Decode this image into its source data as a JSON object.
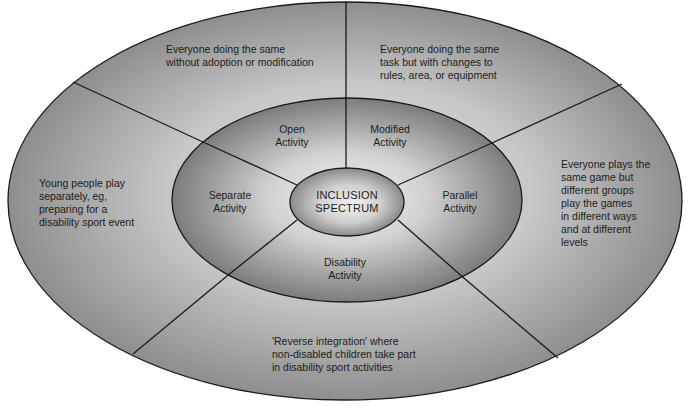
{
  "diagram": {
    "title": "Inclusion Spectrum",
    "type": "concentric-ellipse-segmented",
    "colors": {
      "outer_fill_dark": "#8c8c8c",
      "outer_fill_light": "#d4d4d4",
      "middle_fill_dark": "#7e7e7e",
      "middle_fill_light": "#e4e4e4",
      "core_fill_dark": "#8a8a8a",
      "core_fill_light": "#ececec",
      "stroke": "#1a1a1a",
      "background": "#ffffff"
    },
    "core": {
      "line1": "INCLUSION",
      "line2": "SPECTRUM"
    },
    "segments": [
      {
        "id": "open",
        "inner_label": [
          "Open",
          "Activity"
        ],
        "description": [
          "Everyone doing the same",
          "without adoption or modification"
        ]
      },
      {
        "id": "modified",
        "inner_label": [
          "Modified",
          "Activity"
        ],
        "description": [
          "Everyone doing the same",
          "task but with changes to",
          "rules, area, or equipment"
        ]
      },
      {
        "id": "parallel",
        "inner_label": [
          "Parallel",
          "Activity"
        ],
        "description": [
          "Everyone plays the",
          "same game but",
          "different groups",
          "play the games",
          "in different ways",
          "and at different",
          "levels"
        ]
      },
      {
        "id": "disability",
        "inner_label": [
          "Disability",
          "Activity"
        ],
        "description": [
          "'Reverse integration' where",
          "non-disabled children take part",
          "in disability sport activities"
        ]
      },
      {
        "id": "separate",
        "inner_label": [
          "Separate",
          "Activity"
        ],
        "description": [
          "Young people play",
          "separately, eg,",
          "preparing for a",
          "disability sport event"
        ]
      }
    ]
  }
}
